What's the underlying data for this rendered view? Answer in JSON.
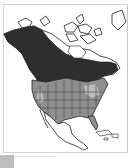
{
  "map": {
    "subject": "species range map",
    "region": "North America",
    "legend_colors": {
      "breeding": "#2e2e2e",
      "year_round_or_winter": "#8f8f8f",
      "secondary": "#bcbcbc",
      "land": "#ffffff",
      "outline": "#222222",
      "frame": "#d4d4d4"
    }
  }
}
